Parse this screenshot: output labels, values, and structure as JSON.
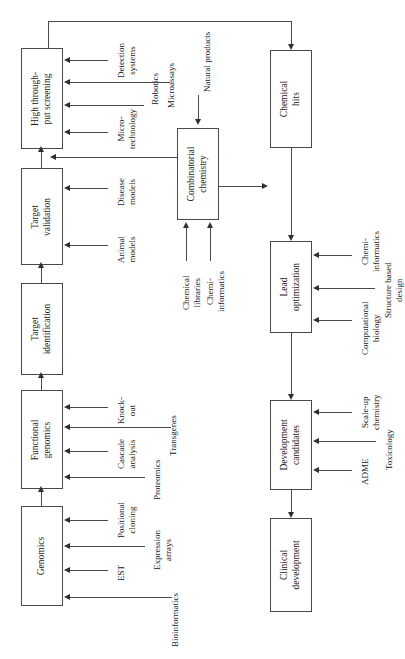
{
  "diagram": {
    "orientation": "rotated-90-ccw",
    "line_color": "#4a4a4a",
    "arrow_color": "#2f2f2f",
    "background": "#ffffff",
    "stages": [
      {
        "id": "high-throughput-screening",
        "label": "High through-\nput screening",
        "line1": "High through-",
        "line2": "put screening"
      },
      {
        "id": "target-validation",
        "label": "Target\nvalidation",
        "line1": "Target",
        "line2": "validation"
      },
      {
        "id": "target-identification",
        "label": "Target\nidentification",
        "line1": "Target",
        "line2": "identification"
      },
      {
        "id": "functional-genomics",
        "label": "Functional\ngenomics",
        "line1": "Functional",
        "line2": "genomics"
      },
      {
        "id": "genomics",
        "label": "Genomics",
        "line1": "Genomics",
        "line2": ""
      },
      {
        "id": "combinatorial-chemistry",
        "label": "Combinatorial\nchemistry",
        "line1": "Combinatorial",
        "line2": "chemistry"
      },
      {
        "id": "chemical-hits",
        "label": "Chemical\nhits",
        "line1": "Chemical",
        "line2": "hits"
      },
      {
        "id": "lead-optimization",
        "label": "Lead\noptimization",
        "line1": "Lead",
        "line2": "optimization"
      },
      {
        "id": "development-candidates",
        "label": "Development\ncandidates",
        "line1": "Development",
        "line2": "candidates"
      },
      {
        "id": "clinical-development",
        "label": "Clinical\ndevelopment",
        "line1": "Clinical",
        "line2": "development"
      }
    ],
    "inputs": {
      "high_throughput_screening": [
        {
          "id": "detection-systems",
          "line1": "Detection",
          "line2": "systems"
        },
        {
          "id": "microassays",
          "line1": "Microassays",
          "line2": ""
        },
        {
          "id": "robotics",
          "line1": "Robotics",
          "line2": ""
        },
        {
          "id": "micro-technology",
          "line1": "Micro-",
          "line2": "technology"
        }
      ],
      "target_validation": [
        {
          "id": "disease-models",
          "line1": "Disease",
          "line2": "models"
        },
        {
          "id": "animal-models",
          "line1": "Animal",
          "line2": "models"
        }
      ],
      "functional_genomics": [
        {
          "id": "knock-out",
          "line1": "Knock-",
          "line2": "out"
        },
        {
          "id": "transgenes",
          "line1": "Transgenes",
          "line2": ""
        },
        {
          "id": "cascade-analysis",
          "line1": "Cascade",
          "line2": "analysis"
        },
        {
          "id": "proteomics",
          "line1": "Proteomics",
          "line2": ""
        }
      ],
      "genomics": [
        {
          "id": "positional-cloning",
          "line1": "Positional",
          "line2": "cloning"
        },
        {
          "id": "expression-arrays",
          "line1": "Expression",
          "line2": "arrays"
        },
        {
          "id": "est",
          "line1": "EST",
          "line2": ""
        },
        {
          "id": "bioinformatics",
          "line1": "Bioinformatics",
          "line2": ""
        }
      ],
      "combinatorial_chemistry": [
        {
          "id": "chemical-libraries",
          "line1": "Chemical",
          "line2": "libraries"
        },
        {
          "id": "chemi-informatics",
          "line1": "Chemi-",
          "line2": "informatics"
        }
      ],
      "chemical_hits": [
        {
          "id": "natural-products",
          "line1": "Natural products",
          "line2": ""
        }
      ],
      "lead_optimization": [
        {
          "id": "chemi-informatics-lead",
          "line1": "Chemi-",
          "line2": "informatics"
        },
        {
          "id": "structure-based-design",
          "line1": "Structure based",
          "line2": "design"
        },
        {
          "id": "computational-biology",
          "line1": "Computational",
          "line2": "biology"
        }
      ],
      "development_candidates": [
        {
          "id": "scale-up-chemistry",
          "line1": "Scale-up",
          "line2": "chemistry"
        },
        {
          "id": "toxicology",
          "line1": "Toxicology",
          "line2": ""
        },
        {
          "id": "adme",
          "line1": "ADME",
          "line2": ""
        }
      ]
    }
  }
}
